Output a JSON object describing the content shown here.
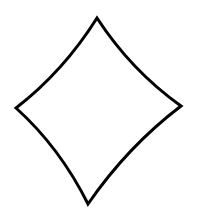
{
  "figure": {
    "shape": "diamond-icon",
    "stroke_color": "#000000",
    "fill_color": "#ffffff",
    "background_color": "#ffffff",
    "vertices": {
      "top": [
        97,
        18
      ],
      "right": [
        181,
        106
      ],
      "bottom": [
        88,
        204
      ],
      "left": [
        16,
        108
      ]
    }
  }
}
